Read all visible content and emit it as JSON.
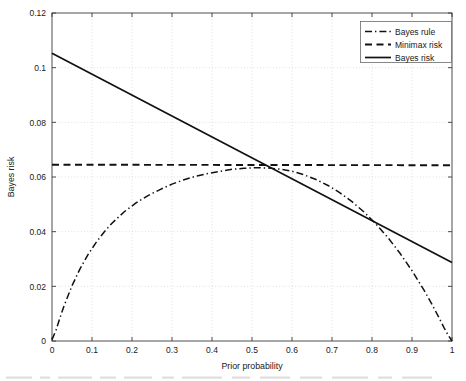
{
  "chart_data": {
    "type": "line",
    "title": "",
    "xlabel": "Prior probability",
    "ylabel": "Bayes risk",
    "xlim": [
      0,
      1
    ],
    "ylim": [
      0,
      0.12
    ],
    "grid": true,
    "legend_position": "top-right",
    "xticks": [
      "0",
      "0.1",
      "0.2",
      "0.3",
      "0.4",
      "0.5",
      "0.6",
      "0.7",
      "0.8",
      "0.9",
      "1"
    ],
    "xtick_values": [
      0,
      0.1,
      0.2,
      0.3,
      0.4,
      0.5,
      0.6,
      0.7,
      0.8,
      0.9,
      1
    ],
    "yticks": [
      "0",
      "0.02",
      "0.04",
      "0.06",
      "0.08",
      "0.1",
      "0.12"
    ],
    "ytick_values": [
      0,
      0.02,
      0.04,
      0.06,
      0.08,
      0.1,
      0.12
    ],
    "series": [
      {
        "name": "Bayes rule",
        "style": "dash-dot",
        "color": "#111111",
        "x": [
          0,
          0.01,
          0.02,
          0.03,
          0.05,
          0.07,
          0.09,
          0.11,
          0.13,
          0.15,
          0.18,
          0.21,
          0.24,
          0.27,
          0.3,
          0.33,
          0.36,
          0.39,
          0.42,
          0.45,
          0.48,
          0.51,
          0.54,
          0.57,
          0.6,
          0.63,
          0.66,
          0.69,
          0.72,
          0.75,
          0.78,
          0.81,
          0.84,
          0.87,
          0.9,
          0.93,
          0.95,
          0.97,
          0.98,
          0.99,
          1
        ],
        "y": [
          0.0005,
          0.004,
          0.0085,
          0.0128,
          0.0202,
          0.0264,
          0.0316,
          0.036,
          0.0398,
          0.0431,
          0.0472,
          0.0505,
          0.0532,
          0.0554,
          0.0574,
          0.059,
          0.0603,
          0.0613,
          0.0621,
          0.0628,
          0.0632,
          0.0634,
          0.0633,
          0.0629,
          0.0621,
          0.0608,
          0.0591,
          0.0569,
          0.0542,
          0.051,
          0.0472,
          0.0428,
          0.0378,
          0.0321,
          0.0257,
          0.0186,
          0.0134,
          0.0078,
          0.0049,
          0.0022,
          0.0
        ]
      },
      {
        "name": "Minimax risk",
        "style": "dashed",
        "color": "#111111",
        "x": [
          0,
          1
        ],
        "y": [
          0.0645,
          0.0643
        ]
      },
      {
        "name": "Bayes risk",
        "style": "solid",
        "color": "#111111",
        "x": [
          0,
          1
        ],
        "y": [
          0.1053,
          0.0287
        ]
      }
    ]
  },
  "legend": {
    "items": [
      {
        "label": "Bayes rule",
        "style": "dash-dot"
      },
      {
        "label": "Minimax risk",
        "style": "dashed"
      },
      {
        "label": "Bayes risk",
        "style": "solid"
      }
    ]
  }
}
